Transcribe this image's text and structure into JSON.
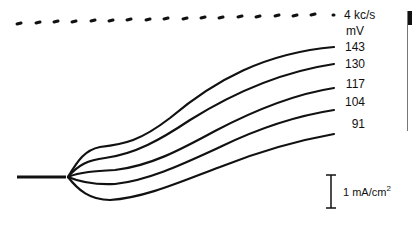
{
  "figure": {
    "timing_marker": {
      "label": "4 kc/s",
      "style": "dashed"
    },
    "unit_label": "mV",
    "curve_labels": [
      "143",
      "130",
      "117",
      "104",
      "91"
    ],
    "scale_bar": {
      "label_main": "1 mA/cm",
      "label_sup": "2"
    },
    "colors": {
      "ink": "#111111",
      "background": "#ffffff"
    }
  }
}
